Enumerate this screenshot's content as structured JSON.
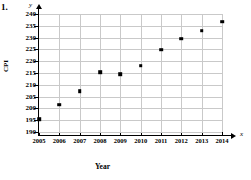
{
  "problem_number": "1.",
  "axis_vars": {
    "y": "y",
    "x": "x"
  },
  "chart_data": {
    "type": "scatter",
    "title": "",
    "xlabel": "Year",
    "ylabel": "CPI",
    "x": [
      2005,
      2006,
      2007,
      2008,
      2009,
      2010,
      2011,
      2012,
      2013,
      2014
    ],
    "values": [
      195.3,
      201.6,
      207.3,
      215.3,
      214.5,
      218.1,
      224.9,
      229.6,
      233.0,
      236.7
    ],
    "categories": [
      "2005",
      "2006",
      "2007",
      "2008",
      "2009",
      "2010",
      "2011",
      "2012",
      "2013",
      "2014"
    ],
    "xtick_labels": [
      "2005",
      "2006",
      "2007",
      "2008",
      "2009",
      "2010",
      "2011",
      "2012",
      "2013",
      "2014"
    ],
    "ytick_labels": [
      "190",
      "195",
      "200",
      "205",
      "210",
      "215",
      "220",
      "225",
      "230",
      "235",
      "240"
    ],
    "yticks": [
      190,
      195,
      200,
      205,
      210,
      215,
      220,
      225,
      230,
      235,
      240
    ],
    "xlim": [
      2005,
      2014
    ],
    "ylim": [
      190,
      240
    ],
    "grid": true,
    "legend": "none",
    "marker_color": "#000000",
    "grid_color": "#c9c9c9",
    "axis_color": "#000000"
  }
}
